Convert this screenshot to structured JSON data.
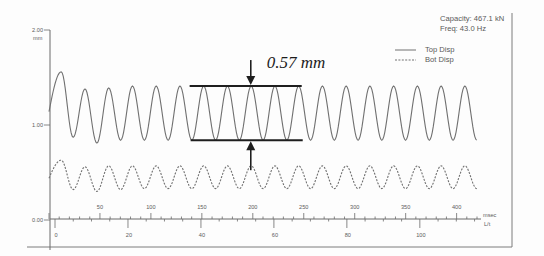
{
  "chart_data": {
    "type": "line",
    "title": "",
    "info": {
      "capacity": "Capacity: 467.1 kN",
      "freq": "Freq: 43.0 Hz"
    },
    "ylabel": "mm",
    "ylim": [
      0,
      2
    ],
    "yticks": [
      0,
      1,
      2
    ],
    "ytick_labels": [
      "0.00",
      "1.00",
      "2.00"
    ],
    "xlim": [
      0,
      420
    ],
    "grid": false,
    "legend_position": "top-right",
    "primary_axis": {
      "label": "msec",
      "ticks": [
        50,
        100,
        150,
        200,
        250,
        300,
        350,
        400
      ],
      "major_step": 50,
      "minor_step": 10
    },
    "secondary_axis": {
      "label": "L/t",
      "ticks": [
        0,
        20,
        40,
        60,
        80,
        100
      ],
      "zero_at_ms": 5.9,
      "ms_per_unit": 3.58,
      "major_step": 20,
      "minor_step": 5
    },
    "legend": [
      {
        "name": "Top Disp",
        "style": "solid"
      },
      {
        "name": "Bot Disp",
        "style": "dashed"
      }
    ],
    "series": [
      {
        "name": "Top Disp",
        "style": "solid",
        "x_unit": "msec",
        "y_unit": "mm",
        "points": [
          [
            0,
            1.14
          ],
          [
            12.0,
            1.56
          ],
          [
            23.7,
            0.87
          ],
          [
            35.3,
            1.38
          ],
          [
            47.0,
            0.81
          ],
          [
            58.6,
            1.39
          ],
          [
            70.3,
            0.84
          ],
          [
            81.9,
            1.41
          ],
          [
            93.6,
            0.84
          ],
          [
            105.2,
            1.41
          ],
          [
            116.9,
            0.84
          ],
          [
            128.5,
            1.41
          ],
          [
            140.2,
            0.84
          ],
          [
            151.8,
            1.41
          ],
          [
            163.5,
            0.84
          ],
          [
            175.1,
            1.41
          ],
          [
            186.8,
            0.84
          ],
          [
            198.4,
            1.41
          ],
          [
            210.1,
            0.84
          ],
          [
            221.7,
            1.41
          ],
          [
            233.4,
            0.84
          ],
          [
            245.0,
            1.41
          ],
          [
            256.7,
            0.84
          ],
          [
            268.3,
            1.41
          ],
          [
            280.0,
            0.84
          ],
          [
            291.6,
            1.41
          ],
          [
            303.3,
            0.84
          ],
          [
            314.9,
            1.41
          ],
          [
            326.6,
            0.84
          ],
          [
            338.2,
            1.41
          ],
          [
            349.9,
            0.84
          ],
          [
            361.5,
            1.41
          ],
          [
            373.2,
            0.84
          ],
          [
            384.8,
            1.41
          ],
          [
            396.5,
            0.84
          ],
          [
            408.1,
            1.41
          ],
          [
            419.8,
            0.84
          ]
        ]
      },
      {
        "name": "Bot Disp",
        "style": "dashed",
        "x_unit": "msec",
        "y_unit": "mm",
        "points": [
          [
            0,
            0.44
          ],
          [
            12.0,
            0.63
          ],
          [
            23.7,
            0.32
          ],
          [
            35.3,
            0.56
          ],
          [
            47.0,
            0.3
          ],
          [
            58.6,
            0.57
          ],
          [
            70.3,
            0.32
          ],
          [
            81.9,
            0.57
          ],
          [
            93.6,
            0.33
          ],
          [
            105.2,
            0.57
          ],
          [
            116.9,
            0.33
          ],
          [
            128.5,
            0.57
          ],
          [
            140.2,
            0.33
          ],
          [
            151.8,
            0.57
          ],
          [
            163.5,
            0.33
          ],
          [
            175.1,
            0.57
          ],
          [
            186.8,
            0.33
          ],
          [
            198.4,
            0.57
          ],
          [
            210.1,
            0.33
          ],
          [
            221.7,
            0.57
          ],
          [
            233.4,
            0.33
          ],
          [
            245.0,
            0.57
          ],
          [
            256.7,
            0.33
          ],
          [
            268.3,
            0.57
          ],
          [
            280.0,
            0.33
          ],
          [
            291.6,
            0.57
          ],
          [
            303.3,
            0.33
          ],
          [
            314.9,
            0.57
          ],
          [
            326.6,
            0.33
          ],
          [
            338.2,
            0.57
          ],
          [
            349.9,
            0.33
          ],
          [
            361.5,
            0.57
          ],
          [
            373.2,
            0.33
          ],
          [
            384.8,
            0.57
          ],
          [
            396.5,
            0.33
          ],
          [
            408.1,
            0.57
          ],
          [
            419.8,
            0.33
          ]
        ]
      }
    ],
    "annotation": {
      "label": "0.57 mm",
      "upper": 1.41,
      "lower": 0.84,
      "x_start_ms": 138,
      "x_end_ms": 248,
      "arrow_x_ms": 198
    }
  }
}
